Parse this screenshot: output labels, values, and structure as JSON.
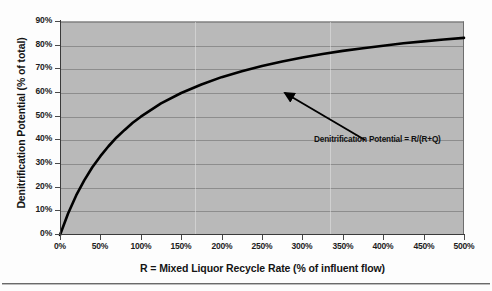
{
  "chart_data": {
    "type": "line",
    "title": "",
    "xlabel": "R = Mixed Liquor Recycle Rate (% of influent flow)",
    "ylabel": "Denitrification Potential (% of total)",
    "xlim": [
      0,
      500
    ],
    "ylim": [
      0,
      90
    ],
    "grid": "horizontal",
    "legend": "none",
    "x_ticklabels": [
      "0%",
      "50%",
      "100%",
      "150%",
      "200%",
      "250%",
      "300%",
      "350%",
      "400%",
      "450%",
      "500%"
    ],
    "x_tickvalues": [
      0,
      50,
      100,
      150,
      200,
      250,
      300,
      350,
      400,
      450,
      500
    ],
    "y_ticklabels": [
      "0%",
      "10%",
      "20%",
      "30%",
      "40%",
      "50%",
      "60%",
      "70%",
      "80%",
      "90%"
    ],
    "y_tickvalues": [
      0,
      10,
      20,
      30,
      40,
      50,
      60,
      70,
      80,
      90
    ],
    "series": [
      {
        "name": "Denitrification Potential = R/(R+Q)",
        "formula": "R/(R+Q), Q = 100%",
        "x": [
          0,
          10,
          20,
          30,
          40,
          50,
          60,
          70,
          80,
          90,
          100,
          125,
          150,
          175,
          200,
          225,
          250,
          275,
          300,
          325,
          350,
          375,
          400,
          425,
          450,
          475,
          500
        ],
        "values": [
          0,
          9.1,
          16.7,
          23.1,
          28.6,
          33.3,
          37.5,
          41.2,
          44.4,
          47.4,
          50,
          55.6,
          60,
          63.6,
          66.7,
          69.2,
          71.4,
          73.3,
          75,
          76.5,
          77.8,
          78.9,
          80,
          81,
          81.8,
          82.6,
          83.3
        ]
      }
    ],
    "annotations": [
      {
        "text": "Denitrification Potential = R/(R+Q)",
        "points_to_x": 185,
        "points_to_y": 65
      }
    ]
  },
  "axes": {
    "x_title": "R = Mixed Liquor Recycle Rate (% of influent flow)",
    "y_title": "Denitrification Potential (% of total)",
    "x_ticks": [
      "0%",
      "50%",
      "100%",
      "150%",
      "200%",
      "250%",
      "300%",
      "350%",
      "400%",
      "450%",
      "500%"
    ],
    "y_ticks": [
      "90%",
      "80%",
      "70%",
      "60%",
      "50%",
      "40%",
      "30%",
      "20%",
      "10%",
      "0%"
    ]
  },
  "annotation": {
    "label": "Denitrification Potential = R/(R+Q)"
  },
  "colors": {
    "plot_background": "#b9b9b9",
    "gridline": "#8d8d8d",
    "curve": "#000000",
    "axis": "#3a3a3a",
    "text": "#141414"
  }
}
